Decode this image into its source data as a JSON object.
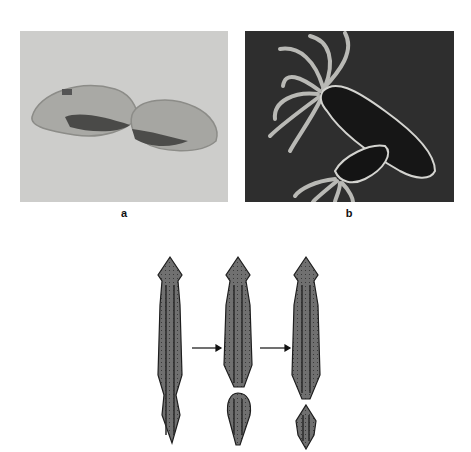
{
  "figure": {
    "panels": [
      {
        "id": "a",
        "label": "a",
        "subject": "paramecium-dividing (binary fission micrograph)"
      },
      {
        "id": "b",
        "label": "b",
        "subject": "hydra-budding (dark-field micrograph)"
      }
    ],
    "diagram": {
      "subject": "planarian-fragmentation-regeneration",
      "stages": 3,
      "arrows": 2
    }
  },
  "colors": {
    "panel_a_bg": "#cbcbc9",
    "panel_b_bg": "#2f2f2f",
    "worm_fill": "#6e6e6e",
    "worm_outline": "#1e1e1e"
  }
}
